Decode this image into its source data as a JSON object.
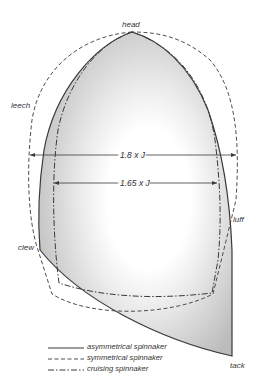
{
  "diagram": {
    "labels": {
      "head": "head",
      "leech": "leech",
      "clew": "clew",
      "luff": "luff",
      "tack": "tack"
    },
    "dimensions": {
      "outer": "1.8 x J",
      "inner": "1.65 x J"
    },
    "legend": [
      {
        "style": "solid",
        "label": "asymmetrical spinnaker"
      },
      {
        "style": "dashed",
        "label": "symmetrical spinnaker"
      },
      {
        "style": "dash-dot",
        "label": "cruising spinnaker"
      }
    ],
    "colors": {
      "line": "#3a3a3a",
      "sail_fill_outer": "#bdbdbd",
      "sail_fill_center": "#ffffff"
    }
  }
}
